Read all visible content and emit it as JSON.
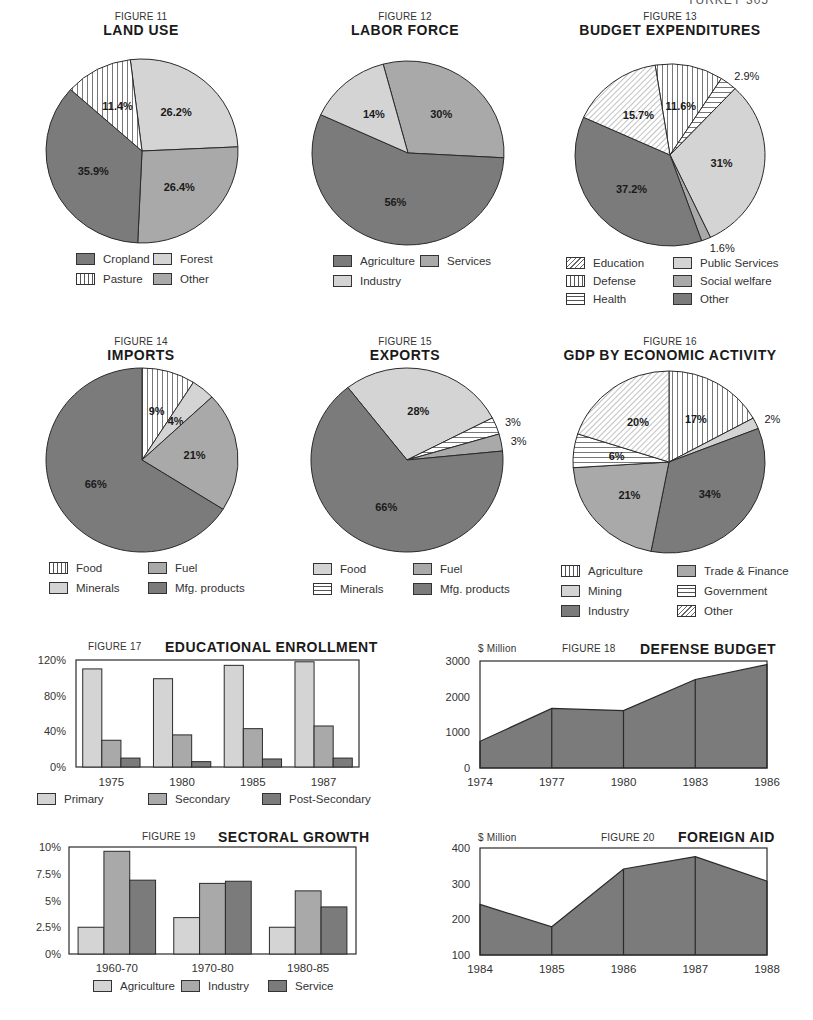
{
  "page": {
    "header": "TURKEY 305"
  },
  "colors": {
    "dark": "#7b7b7b",
    "medium": "#a9a9a9",
    "light": "#d4d4d4",
    "white": "#ffffff",
    "stroke": "#2a2a2a"
  },
  "figures": {
    "fig11": {
      "label": "FIGURE 11",
      "title": "LAND  USE"
    },
    "fig12": {
      "label": "FIGURE 12",
      "title": "LABOR  FORCE"
    },
    "fig13": {
      "label": "FIGURE 13",
      "title": "BUDGET  EXPENDITURES"
    },
    "fig14": {
      "label": "FIGURE 14",
      "title": "IMPORTS"
    },
    "fig15": {
      "label": "FIGURE 15",
      "title": "EXPORTS"
    },
    "fig16": {
      "label": "FIGURE 16",
      "title": "GDP BY ECONOMIC ACTIVITY"
    },
    "fig17": {
      "label": "FIGURE 17",
      "title": "EDUCATIONAL ENROLLMENT"
    },
    "fig18": {
      "label": "FIGURE 18",
      "title": "DEFENSE  BUDGET",
      "unit": "$ Million"
    },
    "fig19": {
      "label": "FIGURE 19",
      "title": "SECTORAL GROWTH"
    },
    "fig20": {
      "label": "FIGURE 20",
      "title": "FOREIGN AID",
      "unit": "$ Million"
    }
  },
  "chart_data": [
    {
      "id": "fig11",
      "type": "pie",
      "title": "LAND USE",
      "start_angle": 353,
      "slices": [
        {
          "name": "Forest",
          "value": 26.2,
          "label": "26.2%",
          "fill": "light"
        },
        {
          "name": "Other",
          "value": 26.4,
          "label": "26.4%",
          "fill": "medium"
        },
        {
          "name": "Cropland",
          "value": 35.9,
          "label": "35.9%",
          "fill": "dark"
        },
        {
          "name": "Pasture",
          "value": 11.4,
          "label": "11.4%",
          "fill": "vert"
        }
      ],
      "legend": [
        {
          "name": "Cropland",
          "fill": "dark"
        },
        {
          "name": "Forest",
          "fill": "light"
        },
        {
          "name": "Pasture",
          "fill": "vert"
        },
        {
          "name": "Other",
          "fill": "medium"
        }
      ]
    },
    {
      "id": "fig12",
      "type": "pie",
      "title": "LABOR FORCE",
      "start_angle": 345,
      "slices": [
        {
          "name": "Services",
          "value": 30,
          "label": "30%",
          "fill": "medium"
        },
        {
          "name": "Agriculture",
          "value": 56,
          "label": "56%",
          "fill": "dark"
        },
        {
          "name": "Industry",
          "value": 14,
          "label": "14%",
          "fill": "light"
        }
      ],
      "legend": [
        {
          "name": "Agriculture",
          "fill": "dark"
        },
        {
          "name": "Services",
          "fill": "medium"
        },
        {
          "name": "Industry",
          "fill": "light"
        }
      ]
    },
    {
      "id": "fig13",
      "type": "pie",
      "title": "BUDGET EXPENDITURES",
      "start_angle": 351,
      "slices": [
        {
          "name": "Defense",
          "value": 11.6,
          "label": "11.6%",
          "fill": "vert"
        },
        {
          "name": "Health",
          "value": 2.9,
          "label": "2.9%",
          "fill": "horiz",
          "outside": true
        },
        {
          "name": "Public Services",
          "value": 31,
          "label": "31%",
          "fill": "light"
        },
        {
          "name": "Social welfare",
          "value": 1.6,
          "label": "1.6%",
          "fill": "medium",
          "outside": true
        },
        {
          "name": "Other",
          "value": 37.2,
          "label": "37.2%",
          "fill": "dark"
        },
        {
          "name": "Education",
          "value": 15.7,
          "label": "15.7%",
          "fill": "diag"
        }
      ],
      "legend": [
        {
          "name": "Education",
          "fill": "diag"
        },
        {
          "name": "Public Services",
          "fill": "light"
        },
        {
          "name": "Defense",
          "fill": "vert"
        },
        {
          "name": "Social welfare",
          "fill": "medium"
        },
        {
          "name": "Health",
          "fill": "horiz"
        },
        {
          "name": "Other",
          "fill": "dark"
        }
      ]
    },
    {
      "id": "fig14",
      "type": "pie",
      "title": "IMPORTS",
      "start_angle": 0,
      "slices": [
        {
          "name": "Food",
          "value": 9,
          "label": "9%",
          "fill": "vert"
        },
        {
          "name": "Minerals",
          "value": 4,
          "label": "4%",
          "fill": "light"
        },
        {
          "name": "Fuel",
          "value": 21,
          "label": "21%",
          "fill": "medium"
        },
        {
          "name": "Mfg. products",
          "value": 66,
          "label": "66%",
          "fill": "dark"
        }
      ],
      "legend": [
        {
          "name": "Food",
          "fill": "vert"
        },
        {
          "name": "Fuel",
          "fill": "medium"
        },
        {
          "name": "Minerals",
          "fill": "light"
        },
        {
          "name": "Mfg. products",
          "fill": "dark"
        }
      ]
    },
    {
      "id": "fig15",
      "type": "pie",
      "title": "EXPORTS",
      "start_angle": 322,
      "slices": [
        {
          "name": "Food",
          "value": 28,
          "label": "28%",
          "fill": "light"
        },
        {
          "name": "Minerals",
          "value": 3,
          "label": "3%",
          "fill": "horiz",
          "outside": true
        },
        {
          "name": "Fuel",
          "value": 3,
          "label": "3%",
          "fill": "medium",
          "outside": true
        },
        {
          "name": "Mfg. products",
          "value": 66,
          "label": "66%",
          "fill": "dark"
        }
      ],
      "legend": [
        {
          "name": "Food",
          "fill": "light"
        },
        {
          "name": "Fuel",
          "fill": "medium"
        },
        {
          "name": "Minerals",
          "fill": "horiz"
        },
        {
          "name": "Mfg. products",
          "fill": "dark"
        }
      ]
    },
    {
      "id": "fig16",
      "type": "pie",
      "title": "GDP BY ECONOMIC ACTIVITY",
      "start_angle": 0,
      "slices": [
        {
          "name": "Agriculture",
          "value": 17,
          "label": "17%",
          "fill": "vert"
        },
        {
          "name": "Mining",
          "value": 2,
          "label": "2%",
          "fill": "light",
          "outside": true
        },
        {
          "name": "Industry",
          "value": 34,
          "label": "34%",
          "fill": "dark"
        },
        {
          "name": "Trade & Finance",
          "value": 21,
          "label": "21%",
          "fill": "medium"
        },
        {
          "name": "Government",
          "value": 6,
          "label": "6%",
          "fill": "horiz"
        },
        {
          "name": "Other",
          "value": 20,
          "label": "20%",
          "fill": "diag"
        }
      ],
      "legend": [
        {
          "name": "Agriculture",
          "fill": "vert"
        },
        {
          "name": "Trade & Finance",
          "fill": "medium"
        },
        {
          "name": "Mining",
          "fill": "light"
        },
        {
          "name": "Government",
          "fill": "horiz"
        },
        {
          "name": "Industry",
          "fill": "dark"
        },
        {
          "name": "Other",
          "fill": "diag"
        }
      ]
    },
    {
      "id": "fig17",
      "type": "bar",
      "title": "EDUCATIONAL ENROLLMENT",
      "categories": [
        "1975",
        "1980",
        "1985",
        "1987"
      ],
      "series": [
        {
          "name": "Primary",
          "values": [
            110,
            99,
            114,
            118
          ],
          "fill": "light"
        },
        {
          "name": "Secondary",
          "values": [
            30,
            36,
            43,
            46
          ],
          "fill": "medium"
        },
        {
          "name": "Post-Secondary",
          "values": [
            10,
            6,
            9,
            10
          ],
          "fill": "dark"
        }
      ],
      "yticks": [
        "0%",
        "40%",
        "80%",
        "120%"
      ],
      "ylim": [
        0,
        120
      ],
      "xlabel": "",
      "ylabel": "",
      "grid": false,
      "legend_position": "bottom"
    },
    {
      "id": "fig18",
      "type": "area",
      "title": "DEFENSE BUDGET",
      "x": [
        "1974",
        "1977",
        "1980",
        "1983",
        "1986"
      ],
      "values": [
        750,
        1670,
        1610,
        2480,
        2900
      ],
      "yticks": [
        "0",
        "1000",
        "2000",
        "3000"
      ],
      "ylim": [
        0,
        3000
      ],
      "ylabel": "$ Million",
      "grid": false
    },
    {
      "id": "fig19",
      "type": "bar",
      "title": "SECTORAL GROWTH",
      "categories": [
        "1960-70",
        "1970-80",
        "1980-85"
      ],
      "series": [
        {
          "name": "Agriculture",
          "values": [
            2.5,
            3.4,
            2.5
          ],
          "fill": "light"
        },
        {
          "name": "Industry",
          "values": [
            9.6,
            6.6,
            5.9
          ],
          "fill": "medium"
        },
        {
          "name": "Service",
          "values": [
            6.9,
            6.8,
            4.4
          ],
          "fill": "dark"
        }
      ],
      "yticks": [
        "0%",
        "2.5%",
        "5%",
        "7.5%",
        "10%"
      ],
      "ylim": [
        0,
        10
      ],
      "grid": false,
      "legend_position": "bottom"
    },
    {
      "id": "fig20",
      "type": "area",
      "title": "FOREIGN AID",
      "x": [
        "1984",
        "1985",
        "1986",
        "1987",
        "1988"
      ],
      "values": [
        242,
        179,
        341,
        376,
        307
      ],
      "yticks": [
        "100",
        "200",
        "300",
        "400"
      ],
      "ylim": [
        100,
        400
      ],
      "ylabel": "$ Million",
      "grid": false
    }
  ]
}
